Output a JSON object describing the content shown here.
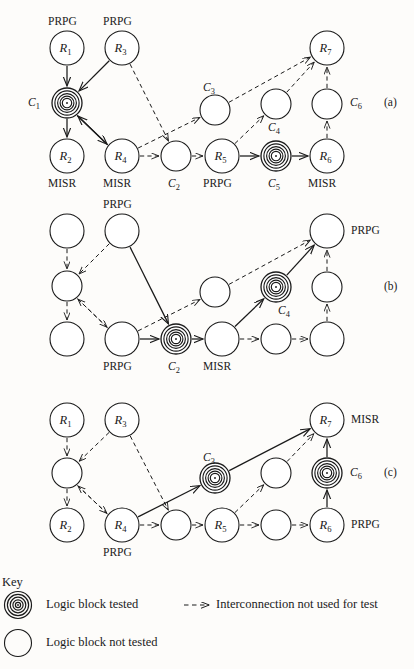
{
  "figure": {
    "type": "diagram",
    "panels": [
      {
        "id": "a",
        "panel_label": "(a)",
        "nodes": [
          {
            "name": "R1",
            "label": "R_1",
            "cx": 67,
            "cy": 48,
            "r": 17,
            "tested": false,
            "role": "PRPG"
          },
          {
            "name": "R3",
            "label": "R_3",
            "cx": 122,
            "cy": 48,
            "r": 17,
            "tested": false,
            "role": "PRPG"
          },
          {
            "name": "C1",
            "label": "",
            "cx": 67,
            "cy": 103,
            "r": 15,
            "tested": true,
            "role": ""
          },
          {
            "name": "C3",
            "label": "",
            "cx": 215,
            "cy": 110,
            "r": 15,
            "tested": false,
            "role": ""
          },
          {
            "name": "C4",
            "label": "",
            "cx": 276,
            "cy": 104,
            "r": 15,
            "tested": false,
            "role": ""
          },
          {
            "name": "C6",
            "label": "",
            "cx": 327,
            "cy": 104,
            "r": 15,
            "tested": false,
            "role": ""
          },
          {
            "name": "R7",
            "label": "R_7",
            "cx": 327,
            "cy": 48,
            "r": 17,
            "tested": false,
            "role": ""
          },
          {
            "name": "R2",
            "label": "R_2",
            "cx": 67,
            "cy": 156,
            "r": 17,
            "tested": false,
            "role": "MISR"
          },
          {
            "name": "R4",
            "label": "R_4",
            "cx": 122,
            "cy": 156,
            "r": 17,
            "tested": false,
            "role": "MISR"
          },
          {
            "name": "C2",
            "label": "",
            "cx": 176,
            "cy": 156,
            "r": 15,
            "tested": false,
            "role": ""
          },
          {
            "name": "R5",
            "label": "R_5",
            "cx": 222,
            "cy": 156,
            "r": 17,
            "tested": false,
            "role": "PRPG"
          },
          {
            "name": "C5",
            "label": "",
            "cx": 276,
            "cy": 156,
            "r": 15,
            "tested": true,
            "role": ""
          },
          {
            "name": "R6",
            "label": "R_6",
            "cx": 327,
            "cy": 156,
            "r": 17,
            "tested": false,
            "role": "MISR"
          }
        ],
        "text_labels": [
          {
            "name": "prpg-r1",
            "text": "PRPG",
            "x": 48,
            "y": 16
          },
          {
            "name": "prpg-r3",
            "text": "PRPG",
            "x": 103,
            "y": 16
          },
          {
            "name": "c1-label",
            "text": "C",
            "sub": "1",
            "x": 28,
            "y": 97,
            "italic": true
          },
          {
            "name": "c3-label",
            "text": "C",
            "sub": "3",
            "x": 203,
            "y": 82,
            "italic": true
          },
          {
            "name": "c4-label",
            "text": "C",
            "sub": "4",
            "x": 268,
            "y": 122,
            "italic": true
          },
          {
            "name": "c6-label",
            "text": "C",
            "sub": "6",
            "x": 350,
            "y": 97,
            "italic": true
          },
          {
            "name": "misr-r2",
            "text": "MISR",
            "x": 48,
            "y": 178
          },
          {
            "name": "misr-r4",
            "text": "MISR",
            "x": 103,
            "y": 178
          },
          {
            "name": "c2-label",
            "text": "C",
            "sub": "2",
            "x": 168,
            "y": 178,
            "italic": true
          },
          {
            "name": "prpg-r5",
            "text": "PRPG",
            "x": 203,
            "y": 178
          },
          {
            "name": "c5-label",
            "text": "C",
            "sub": "5",
            "x": 268,
            "y": 178,
            "italic": true
          },
          {
            "name": "misr-r6",
            "text": "MISR",
            "x": 308,
            "y": 178
          },
          {
            "name": "panel-id-a",
            "text": "(a)",
            "x": 384,
            "y": 97
          }
        ],
        "edges": [
          {
            "from": "R1",
            "to": "C1",
            "style": "solid"
          },
          {
            "from": "R3",
            "to": "C1",
            "style": "solid"
          },
          {
            "from": "C1",
            "to": "R2",
            "style": "solid"
          },
          {
            "from": "C1",
            "to": "R4",
            "style": "solid"
          },
          {
            "from": "R4",
            "to": "C1",
            "style": "solid"
          },
          {
            "from": "R3",
            "to": "C2",
            "style": "dashed"
          },
          {
            "from": "R4",
            "to": "C2",
            "style": "dashed"
          },
          {
            "from": "R4",
            "to": "C3",
            "style": "dashed"
          },
          {
            "from": "C2",
            "to": "R5",
            "style": "dashed"
          },
          {
            "from": "C3",
            "to": "R7",
            "style": "dashed"
          },
          {
            "from": "C4",
            "to": "R7",
            "style": "dashed"
          },
          {
            "from": "R5",
            "to": "C4",
            "style": "dashed"
          },
          {
            "from": "R5",
            "to": "C5",
            "style": "solid"
          },
          {
            "from": "C5",
            "to": "R6",
            "style": "solid"
          },
          {
            "from": "R6",
            "to": "C6",
            "style": "dashed"
          },
          {
            "from": "C6",
            "to": "R7",
            "style": "dashed"
          }
        ]
      },
      {
        "id": "b",
        "panel_label": "(b)",
        "nodes": [
          {
            "name": "R1",
            "label": "",
            "cx": 67,
            "cy": 231,
            "r": 17,
            "tested": false,
            "role": ""
          },
          {
            "name": "R3",
            "label": "",
            "cx": 122,
            "cy": 231,
            "r": 17,
            "tested": false,
            "role": "PRPG"
          },
          {
            "name": "C1",
            "label": "",
            "cx": 67,
            "cy": 286,
            "r": 15,
            "tested": false,
            "role": ""
          },
          {
            "name": "C3",
            "label": "",
            "cx": 215,
            "cy": 292,
            "r": 15,
            "tested": false,
            "role": ""
          },
          {
            "name": "C4",
            "label": "",
            "cx": 276,
            "cy": 287,
            "r": 15,
            "tested": true,
            "role": ""
          },
          {
            "name": "C6",
            "label": "",
            "cx": 327,
            "cy": 287,
            "r": 15,
            "tested": false,
            "role": ""
          },
          {
            "name": "R7",
            "label": "",
            "cx": 327,
            "cy": 231,
            "r": 17,
            "tested": false,
            "role": "PRPG"
          },
          {
            "name": "R2",
            "label": "",
            "cx": 67,
            "cy": 339,
            "r": 17,
            "tested": false,
            "role": ""
          },
          {
            "name": "R4",
            "label": "",
            "cx": 122,
            "cy": 339,
            "r": 17,
            "tested": false,
            "role": "PRPG"
          },
          {
            "name": "C2",
            "label": "",
            "cx": 176,
            "cy": 339,
            "r": 15,
            "tested": true,
            "role": ""
          },
          {
            "name": "R5",
            "label": "",
            "cx": 222,
            "cy": 339,
            "r": 17,
            "tested": false,
            "role": "MISR"
          },
          {
            "name": "C5",
            "label": "",
            "cx": 276,
            "cy": 339,
            "r": 15,
            "tested": false,
            "role": ""
          },
          {
            "name": "R6",
            "label": "",
            "cx": 327,
            "cy": 339,
            "r": 17,
            "tested": false,
            "role": ""
          }
        ],
        "text_labels": [
          {
            "name": "prpg-r3",
            "text": "PRPG",
            "x": 103,
            "y": 199
          },
          {
            "name": "prpg-r7",
            "text": "PRPG",
            "x": 351,
            "y": 225
          },
          {
            "name": "c4-label",
            "text": "C",
            "sub": "4",
            "x": 278,
            "y": 305,
            "italic": true
          },
          {
            "name": "prpg-r4",
            "text": "PRPG",
            "x": 103,
            "y": 361
          },
          {
            "name": "c2-label",
            "text": "C",
            "sub": "2",
            "x": 168,
            "y": 361,
            "italic": true
          },
          {
            "name": "misr-r5",
            "text": "MISR",
            "x": 203,
            "y": 361
          },
          {
            "name": "panel-id-b",
            "text": "(b)",
            "x": 384,
            "y": 281
          }
        ],
        "edges": [
          {
            "from": "R1",
            "to": "C1",
            "style": "dashed"
          },
          {
            "from": "R3",
            "to": "C1",
            "style": "dashed"
          },
          {
            "from": "C1",
            "to": "R2",
            "style": "dashed"
          },
          {
            "from": "C1",
            "to": "R4",
            "style": "dashed"
          },
          {
            "from": "R4",
            "to": "C1",
            "style": "dashed"
          },
          {
            "from": "R3",
            "to": "C2",
            "style": "solid"
          },
          {
            "from": "R4",
            "to": "C2",
            "style": "solid"
          },
          {
            "from": "R4",
            "to": "C3",
            "style": "dashed"
          },
          {
            "from": "C2",
            "to": "R5",
            "style": "solid"
          },
          {
            "from": "C3",
            "to": "R7",
            "style": "dashed"
          },
          {
            "from": "C4",
            "to": "R7",
            "style": "solid"
          },
          {
            "from": "R5",
            "to": "C4",
            "style": "solid"
          },
          {
            "from": "R5",
            "to": "C5",
            "style": "dashed"
          },
          {
            "from": "C5",
            "to": "R6",
            "style": "dashed"
          },
          {
            "from": "R6",
            "to": "C6",
            "style": "dashed"
          },
          {
            "from": "C6",
            "to": "R7",
            "style": "dashed"
          }
        ]
      },
      {
        "id": "c",
        "panel_label": "(c)",
        "nodes": [
          {
            "name": "R1",
            "label": "R_1",
            "cx": 67,
            "cy": 420,
            "r": 17,
            "tested": false,
            "role": ""
          },
          {
            "name": "R3",
            "label": "R_3",
            "cx": 122,
            "cy": 420,
            "r": 17,
            "tested": false,
            "role": ""
          },
          {
            "name": "C1",
            "label": "",
            "cx": 67,
            "cy": 473,
            "r": 15,
            "tested": false,
            "role": ""
          },
          {
            "name": "C3",
            "label": "",
            "cx": 215,
            "cy": 478,
            "r": 15,
            "tested": true,
            "role": ""
          },
          {
            "name": "C4",
            "label": "",
            "cx": 276,
            "cy": 473,
            "r": 15,
            "tested": false,
            "role": ""
          },
          {
            "name": "C6",
            "label": "",
            "cx": 327,
            "cy": 473,
            "r": 15,
            "tested": true,
            "role": ""
          },
          {
            "name": "R7",
            "label": "R_7",
            "cx": 327,
            "cy": 420,
            "r": 17,
            "tested": false,
            "role": "MISR"
          },
          {
            "name": "R2",
            "label": "R_2",
            "cx": 67,
            "cy": 525,
            "r": 17,
            "tested": false,
            "role": ""
          },
          {
            "name": "R4",
            "label": "R_4",
            "cx": 122,
            "cy": 525,
            "r": 17,
            "tested": false,
            "role": "PRPG"
          },
          {
            "name": "C2",
            "label": "",
            "cx": 176,
            "cy": 525,
            "r": 15,
            "tested": false,
            "role": ""
          },
          {
            "name": "R5",
            "label": "R_5",
            "cx": 222,
            "cy": 525,
            "r": 17,
            "tested": false,
            "role": ""
          },
          {
            "name": "C5",
            "label": "",
            "cx": 276,
            "cy": 525,
            "r": 15,
            "tested": false,
            "role": ""
          },
          {
            "name": "R6",
            "label": "R_6",
            "cx": 327,
            "cy": 525,
            "r": 17,
            "tested": false,
            "role": "PRPG"
          }
        ],
        "text_labels": [
          {
            "name": "c3-label",
            "text": "C",
            "sub": "3",
            "x": 203,
            "y": 452,
            "italic": true
          },
          {
            "name": "c6-label",
            "text": "C",
            "sub": "6",
            "x": 350,
            "y": 467,
            "italic": true
          },
          {
            "name": "misr-r7",
            "text": "MISR",
            "x": 351,
            "y": 414
          },
          {
            "name": "prpg-r4",
            "text": "PRPG",
            "x": 103,
            "y": 547
          },
          {
            "name": "prpg-r6",
            "text": "PRPG",
            "x": 351,
            "y": 519
          },
          {
            "name": "panel-id-c",
            "text": "(c)",
            "x": 384,
            "y": 467
          }
        ],
        "edges": [
          {
            "from": "R1",
            "to": "C1",
            "style": "dashed"
          },
          {
            "from": "R3",
            "to": "C1",
            "style": "dashed"
          },
          {
            "from": "C1",
            "to": "R2",
            "style": "dashed"
          },
          {
            "from": "C1",
            "to": "R4",
            "style": "dashed"
          },
          {
            "from": "R4",
            "to": "C1",
            "style": "dashed"
          },
          {
            "from": "R3",
            "to": "C2",
            "style": "dashed"
          },
          {
            "from": "R4",
            "to": "C2",
            "style": "dashed"
          },
          {
            "from": "R4",
            "to": "C3",
            "style": "solid"
          },
          {
            "from": "C2",
            "to": "R5",
            "style": "dashed"
          },
          {
            "from": "C3",
            "to": "R7",
            "style": "solid"
          },
          {
            "from": "C4",
            "to": "R7",
            "style": "dashed"
          },
          {
            "from": "R5",
            "to": "C4",
            "style": "dashed"
          },
          {
            "from": "R5",
            "to": "C5",
            "style": "dashed"
          },
          {
            "from": "C5",
            "to": "R6",
            "style": "dashed"
          },
          {
            "from": "R6",
            "to": "C6",
            "style": "solid"
          },
          {
            "from": "C6",
            "to": "R7",
            "style": "solid"
          }
        ]
      }
    ]
  },
  "key": {
    "title": "Key",
    "items": [
      {
        "name": "logic-block-tested",
        "text": "Logic block tested",
        "symbol": "tested-circle-icon"
      },
      {
        "name": "logic-block-not-tested",
        "text": "Logic block not tested",
        "symbol": "plain-circle-icon"
      },
      {
        "name": "interconnection-unused",
        "text": "Interconnection not used for test",
        "symbol": "dashed-arrow-icon"
      }
    ]
  },
  "colors": {
    "ink": "#1a1a1a",
    "paper": "#fdfcfa"
  }
}
